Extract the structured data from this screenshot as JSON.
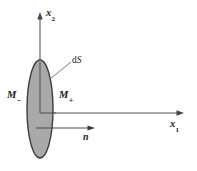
{
  "figure": {
    "background_color": "#ffffff",
    "width": 197,
    "height": 171,
    "axes": {
      "vertical": {
        "name": "x2",
        "base": "x",
        "subscript": "2"
      },
      "horizontal": {
        "name": "x1",
        "base": "x",
        "subscript": "1"
      }
    },
    "labels": {
      "surface_element": "dS",
      "surface_element_prefix": "d",
      "surface_element_symbol": "S",
      "media_minus_base": "M",
      "media_minus_sub": "−",
      "media_plus_base": "M",
      "media_plus_sub": "+",
      "normal_vector": "n"
    },
    "colors": {
      "surface_fill": "#a9a9a9",
      "surface_stroke": "#3c3c3c",
      "axis_stroke": "#555555",
      "leader_stroke": "#6a6a6a",
      "text": "#1c1c1c"
    }
  }
}
